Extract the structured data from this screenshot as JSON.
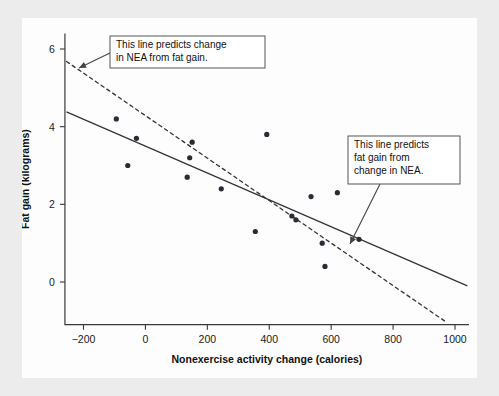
{
  "chart_data": {
    "type": "scatter",
    "title": "",
    "xlabel": "Nonexercise activity change (calories)",
    "ylabel": "Fat gain (kilograms)",
    "xlim": [
      -260,
      1045
    ],
    "ylim": [
      -1.1,
      6.4
    ],
    "xticks": [
      -200,
      0,
      200,
      400,
      600,
      800,
      1000
    ],
    "xtick_labels": [
      "−200",
      "0",
      "200",
      "400",
      "600",
      "800",
      "1000"
    ],
    "yticks": [
      0,
      2,
      4,
      6
    ],
    "ytick_labels": [
      "0",
      "2",
      "4",
      "6"
    ],
    "grid": false,
    "legend": "none",
    "points": [
      {
        "x": -94,
        "y": 4.2
      },
      {
        "x": -57,
        "y": 3.0
      },
      {
        "x": -29,
        "y": 3.7
      },
      {
        "x": 135,
        "y": 2.7
      },
      {
        "x": 143,
        "y": 3.2
      },
      {
        "x": 151,
        "y": 3.6
      },
      {
        "x": 245,
        "y": 2.4
      },
      {
        "x": 355,
        "y": 1.3
      },
      {
        "x": 392,
        "y": 3.8
      },
      {
        "x": 473,
        "y": 1.7
      },
      {
        "x": 486,
        "y": 1.6
      },
      {
        "x": 535,
        "y": 2.2
      },
      {
        "x": 571,
        "y": 1.0
      },
      {
        "x": 580,
        "y": 0.4
      },
      {
        "x": 620,
        "y": 2.3
      },
      {
        "x": 690,
        "y": 1.1
      }
    ],
    "series": [
      {
        "name": "fat-gain-on-nea-regression",
        "style": "solid",
        "description": "This line predicts fat gain from change in NEA.",
        "endpoints": [
          {
            "x": -255,
            "y": 4.38
          },
          {
            "x": 1040,
            "y": -0.1
          }
        ]
      },
      {
        "name": "nea-on-fat-gain-regression",
        "style": "dashed",
        "description": "This line predicts change in NEA from fat gain.",
        "endpoints": [
          {
            "x": -255,
            "y": 5.68
          },
          {
            "x": 975,
            "y": -1.05
          }
        ]
      }
    ],
    "annotations": [
      {
        "name": "dashed-line-callout",
        "lines": [
          "This line predicts change",
          "in NEA from fat gain."
        ],
        "box": {
          "x": 110,
          "y": 36,
          "w": 155,
          "h": 32
        },
        "leader_from": {
          "x": 112,
          "y": 52
        },
        "leader_to": {
          "x": 79,
          "y": 68
        }
      },
      {
        "name": "solid-line-callout",
        "lines": [
          "This line predicts",
          "fat gain from",
          "change in NEA."
        ],
        "box": {
          "x": 348,
          "y": 136,
          "w": 112,
          "h": 48
        },
        "leader_from": {
          "x": 380,
          "y": 184
        },
        "leader_to": {
          "x": 350,
          "y": 244
        }
      }
    ]
  },
  "colors": {
    "page_background": "#ececec",
    "figure_background": "#fdfdfd",
    "axis": "#3a3a3a",
    "point": "#2b2b36",
    "line": "#333333",
    "callout_border": "#555555",
    "text": "#111111"
  }
}
